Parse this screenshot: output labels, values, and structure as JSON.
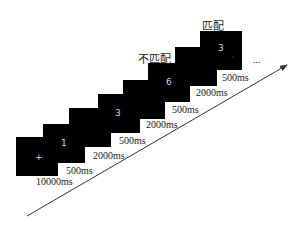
{
  "diagram": {
    "frames": [
      {
        "stimulus": "+",
        "duration": "10000ms"
      },
      {
        "stimulus": "1",
        "duration": "500ms"
      },
      {
        "stimulus": "",
        "duration": "2000ms"
      },
      {
        "stimulus": "3",
        "duration": "500ms"
      },
      {
        "stimulus": "",
        "duration": "2000ms"
      },
      {
        "stimulus": "6",
        "duration": "500ms"
      },
      {
        "stimulus": "",
        "duration": "2000ms"
      },
      {
        "stimulus": "3",
        "duration": "500ms"
      }
    ],
    "labels": {
      "mismatch": "不匹配",
      "match": "匹配",
      "continuation": "..."
    },
    "colors": {
      "frame": "#000000",
      "stimulus": "#d8d8d8",
      "text": "#222222",
      "arrow": "#333333"
    }
  }
}
